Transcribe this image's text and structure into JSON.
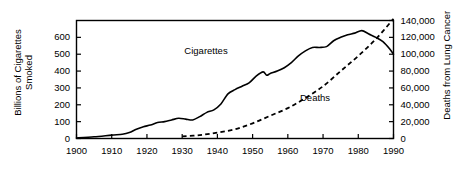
{
  "chart_data": {
    "type": "line",
    "title": "",
    "xlabel": "",
    "ylabel": "Billions of Cigarettes\nSmoked",
    "ylabel_right": "Deaths from Lung Cancer",
    "xlim": [
      1900,
      1990
    ],
    "ylim": [
      0,
      700
    ],
    "ylim_right": [
      0,
      140000
    ],
    "grid": false,
    "legend_position": "inline-annotation",
    "x_ticks": [
      1900,
      1910,
      1920,
      1930,
      1940,
      1950,
      1960,
      1970,
      1980,
      1990
    ],
    "x_tick_labels": [
      "1900",
      "1910",
      "1920",
      "1930",
      "1940",
      "1950",
      "1960",
      "1970",
      "1980",
      "1990"
    ],
    "y_ticks_left": [
      0,
      100,
      200,
      300,
      400,
      500,
      600
    ],
    "y_tick_labels_left": [
      "0",
      "100",
      "200",
      "300",
      "400",
      "500",
      "600"
    ],
    "y_ticks_right": [
      0,
      20000,
      40000,
      60000,
      80000,
      100000,
      120000,
      140000
    ],
    "y_tick_labels_right": [
      "0",
      "20,000",
      "40,000",
      "60,000",
      "80,000",
      "100,000",
      "120,000",
      "140,000"
    ],
    "series": [
      {
        "name": "Cigarettes",
        "axis": "left",
        "style": "solid",
        "color": "#000000",
        "annotation": "Cigarettes",
        "x": [
          1900,
          1905,
          1910,
          1913,
          1915,
          1917,
          1919,
          1921,
          1923,
          1925,
          1927,
          1929,
          1931,
          1933,
          1935,
          1937,
          1939,
          1941,
          1943,
          1945,
          1947,
          1949,
          1951,
          1953,
          1954,
          1955,
          1957,
          1959,
          1961,
          1963,
          1965,
          1967,
          1969,
          1971,
          1973,
          1975,
          1977,
          1979,
          1981,
          1983,
          1985,
          1987,
          1989,
          1990
        ],
        "values": [
          3,
          10,
          20,
          25,
          35,
          55,
          70,
          80,
          95,
          100,
          110,
          120,
          115,
          110,
          130,
          155,
          170,
          205,
          265,
          290,
          310,
          330,
          370,
          395,
          375,
          385,
          400,
          420,
          450,
          490,
          520,
          540,
          540,
          545,
          580,
          600,
          615,
          625,
          640,
          620,
          600,
          575,
          530,
          500
        ]
      },
      {
        "name": "Deaths",
        "axis": "right",
        "style": "dashed",
        "color": "#000000",
        "annotation": "Deaths",
        "x": [
          1930,
          1935,
          1940,
          1945,
          1950,
          1955,
          1960,
          1965,
          1970,
          1975,
          1980,
          1985,
          1990
        ],
        "values": [
          2500,
          4000,
          7000,
          11000,
          18000,
          27000,
          36000,
          48000,
          62000,
          80000,
          98000,
          118000,
          142000
        ]
      }
    ],
    "annotations": [
      {
        "text": "Cigarettes",
        "x": 1938,
        "y": 520
      },
      {
        "text": "Deaths",
        "x": 1968,
        "y": 48000
      }
    ]
  }
}
